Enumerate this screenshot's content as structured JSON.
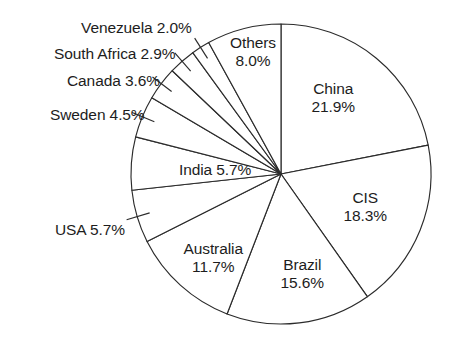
{
  "chart_data": {
    "type": "pie",
    "title": "",
    "subtitle": "",
    "xlabel": "",
    "ylabel": "",
    "legend_position": "none",
    "grid": false,
    "start_angle_deg": 0,
    "direction": "clockwise",
    "units": "percent",
    "categories": [
      "China",
      "CIS",
      "Brazil",
      "Australia",
      "USA",
      "India",
      "Sweden",
      "Canada",
      "South Africa",
      "Venezuela",
      "Others"
    ],
    "values": [
      21.9,
      18.3,
      15.6,
      11.7,
      5.7,
      5.7,
      4.5,
      3.6,
      2.9,
      2.0,
      8.0
    ],
    "slices": [
      {
        "name": "China",
        "value": 21.9,
        "label_line1": "China",
        "label_line2": "21.9%",
        "placement": "inside",
        "x": 333,
        "y": 80,
        "align": "center"
      },
      {
        "name": "CIS",
        "value": 18.3,
        "label_line1": "CIS",
        "label_line2": "18.3%",
        "placement": "inside",
        "x": 365,
        "y": 189,
        "align": "center"
      },
      {
        "name": "Brazil",
        "value": 15.6,
        "label_line1": "Brazil",
        "label_line2": "15.6%",
        "placement": "inside",
        "x": 302,
        "y": 256,
        "align": "center"
      },
      {
        "name": "Australia",
        "value": 11.7,
        "label_line1": "Australia",
        "label_line2": "11.7%",
        "placement": "inside",
        "x": 213,
        "y": 240,
        "align": "center"
      },
      {
        "name": "USA",
        "value": 5.7,
        "label_line1": "USA 5.7%",
        "label_line2": "",
        "placement": "outside",
        "x": 125,
        "y": 221,
        "align": "right"
      },
      {
        "name": "India",
        "value": 5.7,
        "label_line1": "India 5.7%",
        "label_line2": "",
        "placement": "inside",
        "x": 215,
        "y": 161,
        "align": "center"
      },
      {
        "name": "Sweden",
        "value": 4.5,
        "label_line1": "Sweden 4.5%",
        "label_line2": "",
        "placement": "outside",
        "x": 145,
        "y": 106,
        "align": "right"
      },
      {
        "name": "Canada",
        "value": 3.6,
        "label_line1": "Canada 3.6%",
        "label_line2": "",
        "placement": "outside",
        "x": 160,
        "y": 72,
        "align": "right"
      },
      {
        "name": "South Africa",
        "value": 2.9,
        "label_line1": "South Africa 2.9%",
        "label_line2": "",
        "placement": "outside",
        "x": 176,
        "y": 45,
        "align": "right"
      },
      {
        "name": "Venezuela",
        "value": 2.0,
        "label_line1": "Venezuela 2.0%",
        "label_line2": "",
        "placement": "outside",
        "x": 192,
        "y": 19,
        "align": "right"
      },
      {
        "name": "Others",
        "value": 8.0,
        "label_line1": "Others",
        "label_line2": "8.0%",
        "placement": "inside",
        "x": 253,
        "y": 34,
        "align": "center"
      }
    ],
    "geometry": {
      "cx": 281,
      "cy": 174,
      "r": 150
    },
    "style": {
      "slice_fill": "#ffffff",
      "outline": "#2b2b2b",
      "text": "#1d1d1d",
      "background": "#ffffff"
    }
  }
}
